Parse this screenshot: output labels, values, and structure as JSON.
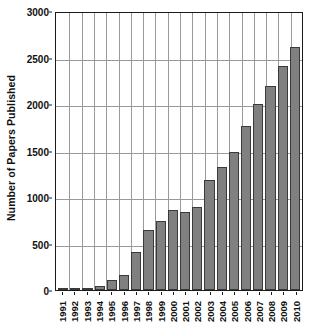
{
  "chart_data": {
    "type": "bar",
    "title": "",
    "xlabel": "",
    "ylabel": "Number of Papers Published",
    "ylim": [
      0,
      3000
    ],
    "ytick_values": [
      0,
      500,
      1000,
      1500,
      2000,
      2500,
      3000
    ],
    "ytick_labels": [
      "0",
      "500",
      "1000",
      "1500",
      "2000",
      "2500",
      "3000"
    ],
    "grid": "both",
    "legend": "none",
    "bar_color": "#808080",
    "bar_edge_color": "#3a3a3a",
    "grid_color": "#9a9a9a",
    "axis_color": "#1a1a1a",
    "categories": [
      "1991",
      "1992",
      "1993",
      "1994",
      "1995",
      "1996",
      "1997",
      "1998",
      "1999",
      "2000",
      "2001",
      "2002",
      "2003",
      "2004",
      "2005",
      "2006",
      "2007",
      "2008",
      "2009",
      "2010"
    ],
    "values": [
      8,
      15,
      25,
      40,
      105,
      165,
      410,
      650,
      745,
      865,
      835,
      895,
      1185,
      1325,
      1485,
      1760,
      1995,
      2190,
      2405,
      2610
    ]
  }
}
